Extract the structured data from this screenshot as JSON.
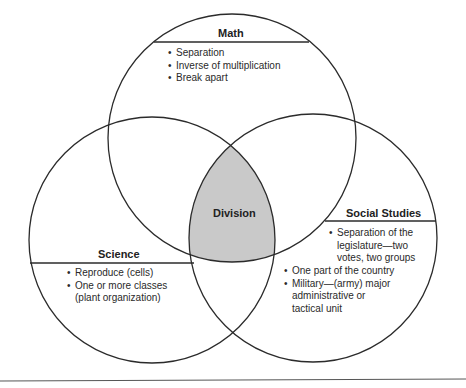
{
  "diagram": {
    "type": "venn",
    "center_label": "Division",
    "circles": [
      {
        "name": "Math",
        "title": "Math",
        "items": [
          "Separation",
          "Inverse of multiplication",
          "Break apart"
        ]
      },
      {
        "name": "Science",
        "title": "Science",
        "items": [
          "Reproduce (cells)",
          "One or more classes\n(plant organization)"
        ]
      },
      {
        "name": "Social Studies",
        "title": "Social Studies",
        "items": [
          "Separation of the\nlegislature—two\nvotes, two groups",
          "One part of the country",
          "Military—(army) major\nadministrative or\ntactical unit"
        ]
      }
    ],
    "colors": {
      "stroke": "#2b2b2b",
      "center_fill": "#c9c9c9",
      "background": "#ffffff"
    }
  }
}
